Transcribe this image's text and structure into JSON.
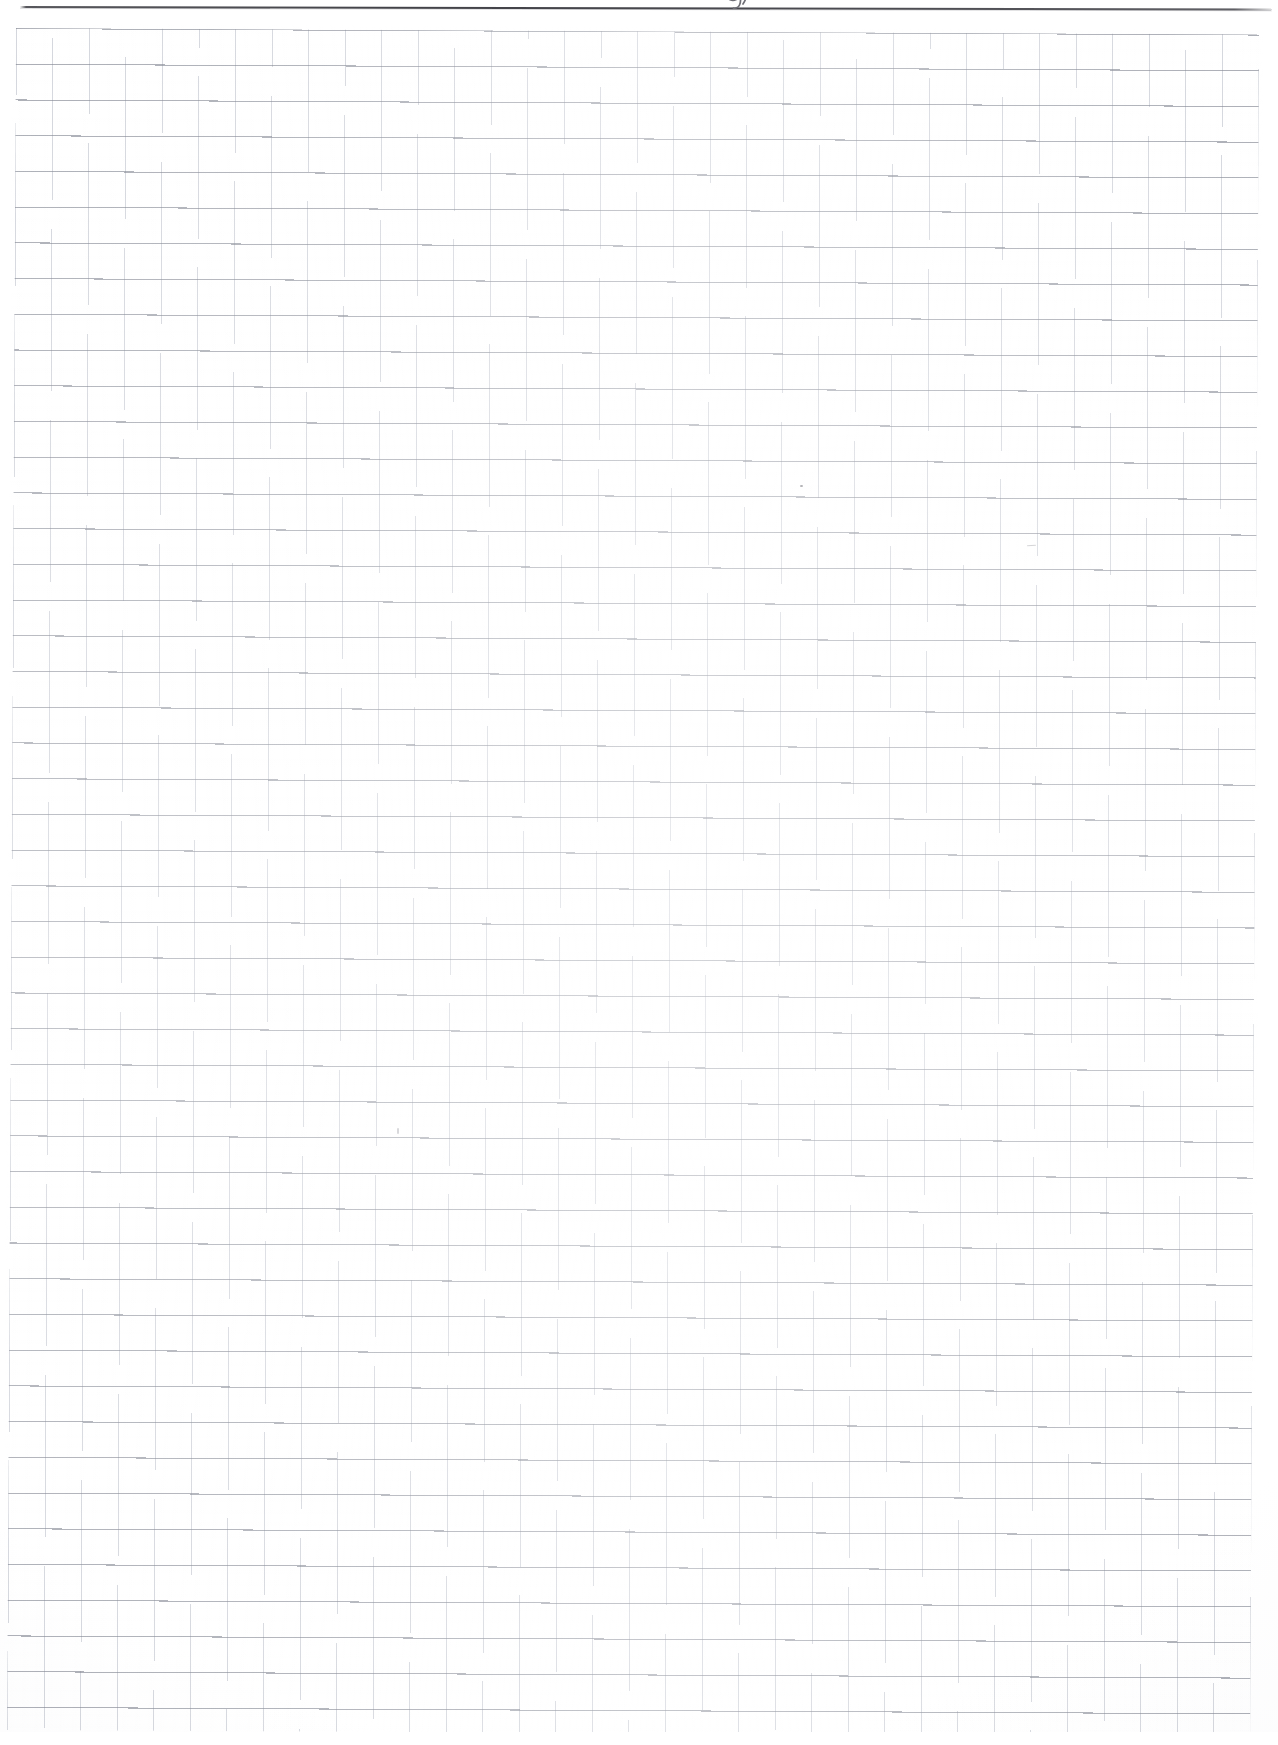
{
  "document": {
    "type": "scanned-graph-paper",
    "page_width": 1278,
    "page_height": 1745,
    "paper_color": "#ffffff",
    "content_text": "",
    "notes_text": ""
  },
  "top_rule": {
    "name": "ruled-margin-line",
    "color": "#3c3c42",
    "thickness_px": 2.4,
    "start_x": 20,
    "end_x": 1272,
    "y": 7,
    "label": ""
  },
  "handwriting": {
    "glyph": "g",
    "description": "cursive descender cut off at top edge",
    "color": "#6a6a70",
    "x": 714,
    "y": -16
  },
  "grid": {
    "name": "quadrille-grid",
    "cell_width_px": 36.55,
    "cell_height_px": 35.72,
    "columns": 34,
    "rows": 48,
    "left_px": 16,
    "top_px": 28,
    "right_px": 1259,
    "bottom_px": 1730,
    "vertical_line_color": "#969cac",
    "horizontal_line_color": "#7e828e",
    "rotation_deg": 0.3
  },
  "marks": [
    {
      "name": "pencil-speck",
      "x": 800,
      "y": 485,
      "color": "#76767c"
    },
    {
      "name": "pencil-smudge",
      "x": 1027,
      "y": 545,
      "color": "#96969c"
    },
    {
      "name": "pencil-tick",
      "x": 397,
      "y": 1128,
      "color": "#9c9ca2"
    }
  ]
}
